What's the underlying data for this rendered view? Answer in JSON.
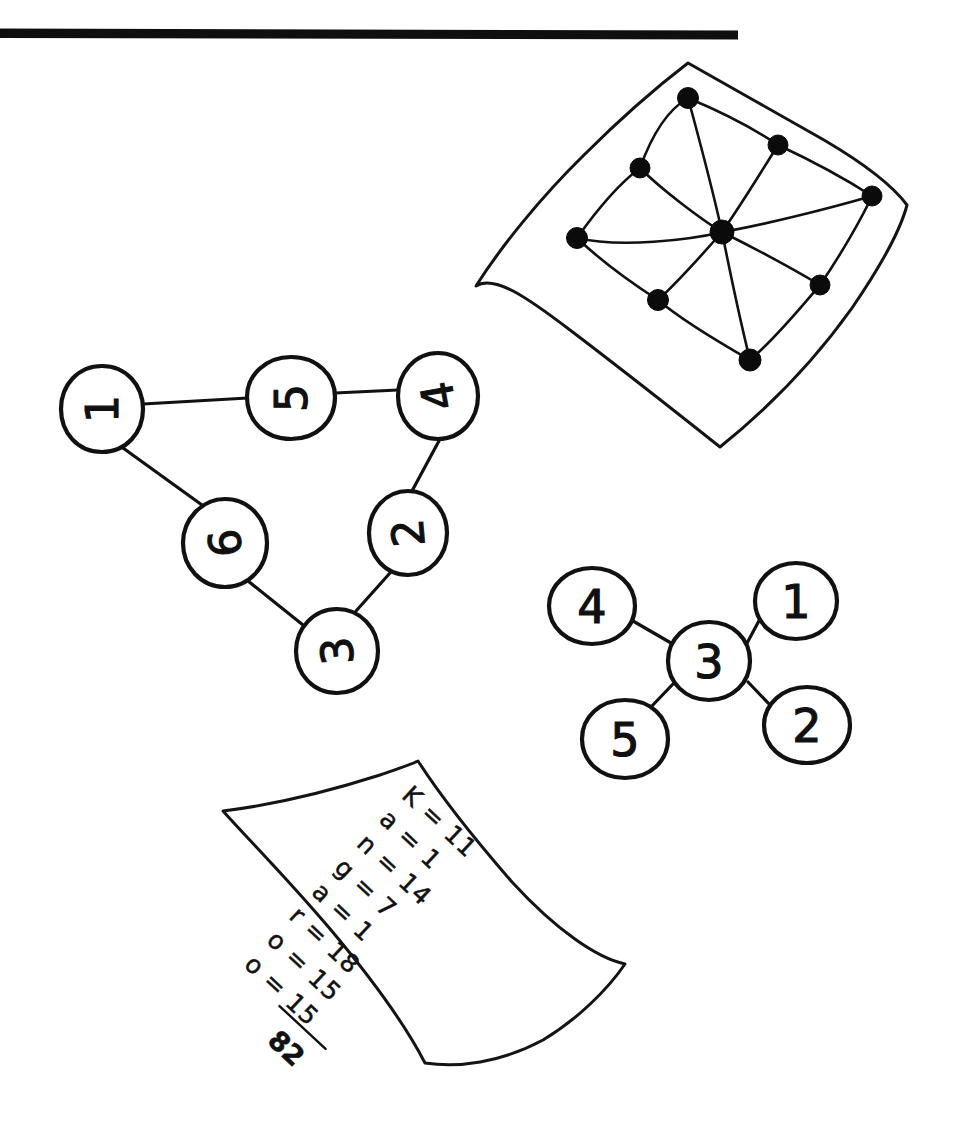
{
  "page": {
    "background_color": "#ffffff",
    "ink_color": "#111111",
    "width": 959,
    "height": 1124
  },
  "header_rule": {
    "label": "horizontal divider rule",
    "x_start": 0,
    "x_end": 738,
    "y": 32,
    "thickness": 9,
    "color": "#0f0f0f"
  },
  "figures": [
    {
      "id": "embedded-graph-sheet",
      "caption": "Graph of 9 solid vertices drawn on a curved sheet",
      "vertex_count": 9,
      "edge_count": 16
    },
    {
      "id": "cycle-graph",
      "caption": "Six-vertex cycle with numbered circular vertices",
      "vertex_count": 6,
      "edge_count": 6
    },
    {
      "id": "star-graph",
      "caption": "Star graph with centre vertex 3 and four leaves",
      "vertex_count": 5,
      "edge_count": 4
    },
    {
      "id": "kangaroo-note",
      "caption": "Curved note sheet listing letter values for KANGAROO"
    }
  ],
  "cycle_graph": {
    "name": "cycle-graph",
    "nodes": [
      {
        "id": "n1",
        "label": "1",
        "cx": 102,
        "cy": 409,
        "rx": 41,
        "ry": 43,
        "rotation": -90
      },
      {
        "id": "n5",
        "label": "5",
        "cx": 291,
        "cy": 398,
        "rx": 44,
        "ry": 41,
        "rotation": -90
      },
      {
        "id": "n4",
        "label": "4",
        "cx": 438,
        "cy": 396,
        "rx": 40,
        "ry": 43,
        "rotation": -100
      },
      {
        "id": "n2",
        "label": "2",
        "cx": 408,
        "cy": 533,
        "rx": 39,
        "ry": 42,
        "rotation": -95
      },
      {
        "id": "n3",
        "label": "3",
        "cx": 337,
        "cy": 651,
        "rx": 41,
        "ry": 42,
        "rotation": -95
      },
      {
        "id": "n6",
        "label": "6",
        "cx": 225,
        "cy": 543,
        "rx": 42,
        "ry": 44,
        "rotation": -95
      }
    ],
    "edges": [
      {
        "from": "n1",
        "to": "n5"
      },
      {
        "from": "n5",
        "to": "n4"
      },
      {
        "from": "n4",
        "to": "n2"
      },
      {
        "from": "n2",
        "to": "n3"
      },
      {
        "from": "n3",
        "to": "n6"
      },
      {
        "from": "n6",
        "to": "n1"
      }
    ]
  },
  "star_graph": {
    "name": "star-graph",
    "nodes": [
      {
        "id": "s3",
        "label": "3",
        "cx": 709,
        "cy": 661,
        "rx": 41,
        "ry": 39,
        "rotation": 0,
        "role": "center"
      },
      {
        "id": "s4",
        "label": "4",
        "cx": 592,
        "cy": 606,
        "rx": 43,
        "ry": 38,
        "rotation": 0,
        "role": "leaf"
      },
      {
        "id": "s1",
        "label": "1",
        "cx": 796,
        "cy": 601,
        "rx": 41,
        "ry": 38,
        "rotation": 0,
        "role": "leaf"
      },
      {
        "id": "s5",
        "label": "5",
        "cx": 625,
        "cy": 739,
        "rx": 43,
        "ry": 39,
        "rotation": 0,
        "role": "leaf"
      },
      {
        "id": "s2",
        "label": "2",
        "cx": 807,
        "cy": 725,
        "rx": 43,
        "ry": 38,
        "rotation": 0,
        "role": "leaf"
      }
    ],
    "edges": [
      {
        "from": "s3",
        "to": "s4"
      },
      {
        "from": "s3",
        "to": "s1"
      },
      {
        "from": "s3",
        "to": "s5"
      },
      {
        "from": "s3",
        "to": "s2"
      }
    ]
  },
  "sheet_graph": {
    "name": "embedded-graph-sheet",
    "sheet_outline": "M 688 63 L 816 132 L 878 178 L 906 212 L 888 268 L 836 344 L 786 404 L 718 446 L 612 366 L 540 322 L 492 296 L 476 286 L 516 236 L 578 160 L 640 100 Z",
    "nodes": [
      {
        "id": "g-center",
        "cx": 722,
        "cy": 232,
        "r": 11
      },
      {
        "id": "g-top",
        "cx": 688,
        "cy": 98,
        "r": 10
      },
      {
        "id": "g-upper-right",
        "cx": 778,
        "cy": 145,
        "r": 10
      },
      {
        "id": "g-right",
        "cx": 872,
        "cy": 196,
        "r": 10
      },
      {
        "id": "g-lower-right",
        "cx": 820,
        "cy": 285,
        "r": 10
      },
      {
        "id": "g-bottom",
        "cx": 750,
        "cy": 360,
        "r": 11
      },
      {
        "id": "g-lower-left",
        "cx": 658,
        "cy": 300,
        "r": 10
      },
      {
        "id": "g-left",
        "cx": 577,
        "cy": 238,
        "r": 10
      },
      {
        "id": "g-upper-left",
        "cx": 640,
        "cy": 168,
        "r": 10
      }
    ],
    "edges": [
      {
        "from": "g-top",
        "to": "g-center"
      },
      {
        "from": "g-upper-right",
        "to": "g-center"
      },
      {
        "from": "g-right",
        "to": "g-center"
      },
      {
        "from": "g-lower-right",
        "to": "g-center"
      },
      {
        "from": "g-bottom",
        "to": "g-center"
      },
      {
        "from": "g-lower-left",
        "to": "g-center"
      },
      {
        "from": "g-left",
        "to": "g-center"
      },
      {
        "from": "g-top",
        "to": "g-upper-left"
      },
      {
        "from": "g-upper-left",
        "to": "g-left"
      },
      {
        "from": "g-left",
        "to": "g-lower-left"
      },
      {
        "from": "g-lower-left",
        "to": "g-bottom"
      },
      {
        "from": "g-bottom",
        "to": "g-lower-right"
      },
      {
        "from": "g-lower-right",
        "to": "g-right"
      },
      {
        "from": "g-right",
        "to": "g-upper-right"
      },
      {
        "from": "g-upper-right",
        "to": "g-top"
      }
    ]
  },
  "note": {
    "name": "kangaroo-note",
    "sheet_outline": "M 223 811 C 290 800 358 782 418 761 C 452 800 500 850 548 896 C 585 930 610 952 625 964 C 600 1000 560 1034 510 1052 C 478 1062 448 1064 425 1063 C 400 1030 360 982 318 935 C 280 893 246 850 223 811 Z",
    "rotation": 43,
    "word": "Kangaroo",
    "lines": [
      {
        "letter": "K",
        "eq": "=",
        "value": "11",
        "text": "K = 11"
      },
      {
        "letter": "a",
        "eq": "=",
        "value": "1",
        "text": "a = 1"
      },
      {
        "letter": "n",
        "eq": "=",
        "value": "14",
        "text": "n = 14"
      },
      {
        "letter": "g",
        "eq": "=",
        "value": "7",
        "text": "g = 7"
      },
      {
        "letter": "a",
        "eq": "=",
        "value": "1",
        "text": "a = 1"
      },
      {
        "letter": "r",
        "eq": "=",
        "value": "18",
        "text": "r = 18"
      },
      {
        "letter": "o",
        "eq": "=",
        "value": "15",
        "text": "o = 15"
      },
      {
        "letter": "o",
        "eq": "=",
        "value": "15",
        "text": "o = 15"
      }
    ],
    "total": "82"
  }
}
